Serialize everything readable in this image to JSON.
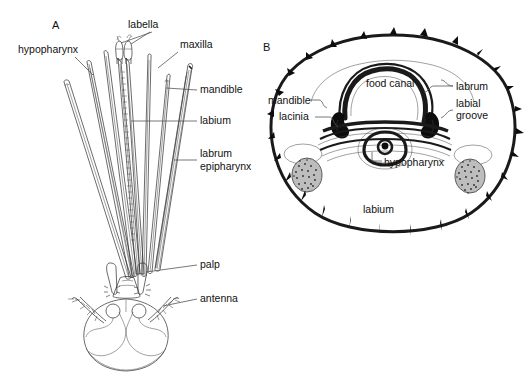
{
  "figure": {
    "background_color": "#ffffff",
    "ink_color": "#1a1a1a",
    "leader_color": "#555555"
  },
  "panels": [
    {
      "id": "A",
      "letter": "A",
      "caption": "Dissected stylet bundle and head capsule",
      "labels": [
        {
          "key": "labella",
          "text": "labella",
          "x": 128,
          "y": 28,
          "anchor": "start"
        },
        {
          "key": "hypopharynx",
          "text": "hypopharynx",
          "x": 18,
          "y": 53,
          "anchor": "start"
        },
        {
          "key": "maxilla",
          "text": "maxilla",
          "x": 180,
          "y": 48,
          "anchor": "start"
        },
        {
          "key": "mandible",
          "text": "mandible",
          "x": 200,
          "y": 93,
          "anchor": "start"
        },
        {
          "key": "labium",
          "text": "labium",
          "x": 200,
          "y": 124,
          "anchor": "start"
        },
        {
          "key": "labrum",
          "text": "labrum",
          "x": 200,
          "y": 157,
          "anchor": "start"
        },
        {
          "key": "epipharynx",
          "text": "epipharynx",
          "x": 200,
          "y": 170,
          "anchor": "start"
        },
        {
          "key": "palp",
          "text": "palp",
          "x": 200,
          "y": 268,
          "anchor": "start"
        },
        {
          "key": "antenna",
          "text": "antenna",
          "x": 200,
          "y": 302,
          "anchor": "start"
        }
      ]
    },
    {
      "id": "B",
      "letter": "B",
      "caption": "Transverse section through the proboscis",
      "labels": [
        {
          "key": "food-canal",
          "text": "food canal",
          "x": 366,
          "y": 87,
          "anchor": "start"
        },
        {
          "key": "labrum",
          "text": "labrum",
          "x": 456,
          "y": 90,
          "anchor": "start"
        },
        {
          "key": "labial-groove",
          "text": "labial",
          "x": 456,
          "y": 107,
          "anchor": "start"
        },
        {
          "key": "labial-groove2",
          "text": "groove",
          "x": 456,
          "y": 119,
          "anchor": "start"
        },
        {
          "key": "mandible",
          "text": "mandible",
          "x": 268,
          "y": 104,
          "anchor": "start"
        },
        {
          "key": "lacinia",
          "text": "lacinia",
          "x": 279,
          "y": 120,
          "anchor": "start"
        },
        {
          "key": "hypopharynx",
          "text": "hypopharynx",
          "x": 384,
          "y": 166,
          "anchor": "start"
        },
        {
          "key": "labium",
          "text": "labium",
          "x": 363,
          "y": 213,
          "anchor": "start"
        }
      ]
    }
  ]
}
